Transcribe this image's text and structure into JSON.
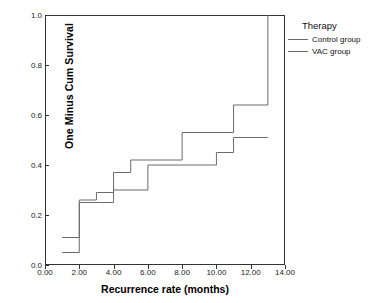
{
  "chart_data": {
    "type": "line",
    "subtype": "kaplan-meier-step",
    "title": "",
    "xlabel": "Recurrence rate (months)",
    "ylabel": "One Minus Cum Survival",
    "xlim": [
      0,
      14
    ],
    "ylim": [
      0.0,
      1.0
    ],
    "xticks": [
      "0.00",
      "2.00",
      "4.00",
      "6.00",
      "8.00",
      "10.00",
      "12.00",
      "14.00"
    ],
    "xtick_values": [
      0,
      2,
      4,
      6,
      8,
      10,
      12,
      14
    ],
    "yticks": [
      "0.0",
      "0.2",
      "0.4",
      "0.6",
      "0.8",
      "1.0"
    ],
    "ytick_values": [
      0.0,
      0.2,
      0.4,
      0.6,
      0.8,
      1.0
    ],
    "grid": false,
    "legend_position": "right",
    "legend_title": "Therapy",
    "series": [
      {
        "name": "Control group",
        "color": "#6b6b6b",
        "x": [
          1.0,
          2.0,
          2.0,
          3.0,
          3.0,
          4.0,
          4.0,
          5.0,
          5.0,
          8.0,
          8.0,
          11.0,
          11.0,
          13.0,
          13.0
        ],
        "y": [
          0.11,
          0.11,
          0.26,
          0.26,
          0.29,
          0.29,
          0.37,
          0.37,
          0.42,
          0.42,
          0.53,
          0.53,
          0.64,
          0.64,
          1.0
        ]
      },
      {
        "name": "VAC group",
        "color": "#6b6b6b",
        "x": [
          1.0,
          2.0,
          2.0,
          4.0,
          4.0,
          6.0,
          6.0,
          10.0,
          10.0,
          11.0,
          11.0,
          13.0
        ],
        "y": [
          0.05,
          0.05,
          0.25,
          0.25,
          0.3,
          0.3,
          0.4,
          0.4,
          0.45,
          0.45,
          0.51,
          0.51
        ]
      }
    ]
  },
  "legend": {
    "title": "Therapy",
    "entries": [
      {
        "label": "Control group"
      },
      {
        "label": "VAC group"
      }
    ]
  },
  "axes": {
    "x_title": "Recurrence rate (months)",
    "y_title": "One Minus Cum Survival",
    "x_tick_labels": [
      "0.00",
      "2.00",
      "4.00",
      "6.00",
      "8.00",
      "10.00",
      "12.00",
      "14.00"
    ],
    "y_tick_labels": [
      "0.0",
      "0.2",
      "0.4",
      "0.6",
      "0.8",
      "1.0"
    ]
  },
  "colors": {
    "line": "#6b6b6b",
    "frame": "#333333",
    "text": "#000000",
    "background": "#ffffff"
  }
}
